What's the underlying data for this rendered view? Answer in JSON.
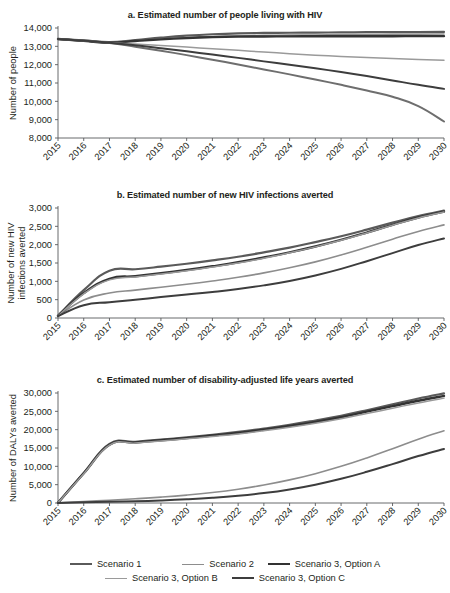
{
  "figure": {
    "x_categories": [
      "2015",
      "2016",
      "2017",
      "2018",
      "2019",
      "2020",
      "2021",
      "2022",
      "2023",
      "2024",
      "2025",
      "2026",
      "2027",
      "2028",
      "2029",
      "2030"
    ],
    "legend": {
      "items": [
        {
          "label": "Scenario 1",
          "color": "#5a5a5a",
          "width": 2.2
        },
        {
          "label": "Scenario 2",
          "color": "#8d8d8d",
          "width": 1.6
        },
        {
          "label": "Scenario 3, Option A",
          "color": "#333333",
          "width": 2.4
        },
        {
          "label": "Scenario 3, Option B",
          "color": "#9a9a9a",
          "width": 1.5
        },
        {
          "label": "Scenario 3, Option C",
          "color": "#3d3d3d",
          "width": 2.0
        }
      ]
    }
  },
  "chart_data": [
    {
      "type": "line",
      "title": "a. Estimated number of people living with HIV",
      "xlabel": "",
      "ylabel": "Number of people",
      "ylabel_lines": [
        "Number of people"
      ],
      "x": [
        2015,
        2016,
        2017,
        2018,
        2019,
        2020,
        2021,
        2022,
        2023,
        2024,
        2025,
        2026,
        2027,
        2028,
        2029,
        2030
      ],
      "categories": [
        "2015",
        "2016",
        "2017",
        "2018",
        "2019",
        "2020",
        "2021",
        "2022",
        "2023",
        "2024",
        "2025",
        "2026",
        "2027",
        "2028",
        "2029",
        "2030"
      ],
      "ylim": [
        8000,
        14000
      ],
      "yticks": [
        8000,
        9000,
        10000,
        11000,
        12000,
        13000,
        14000
      ],
      "ytick_labels": [
        "8,000",
        "9,000",
        "10,000",
        "11,000",
        "12,000",
        "13,000",
        "14,000"
      ],
      "grid": false,
      "legend_position": "figure-bottom",
      "series": [
        {
          "name": "Scenario 1",
          "color": "#5a5a5a",
          "width": 2.2,
          "values": [
            13400,
            13320,
            13230,
            13340,
            13470,
            13580,
            13660,
            13710,
            13730,
            13740,
            13750,
            13760,
            13770,
            13775,
            13780,
            13785
          ]
        },
        {
          "name": "Scenario 2",
          "color": "#8d8d8d",
          "width": 1.6,
          "values": [
            13400,
            13310,
            13220,
            13300,
            13400,
            13480,
            13540,
            13580,
            13600,
            13610,
            13620,
            13630,
            13640,
            13650,
            13660,
            13670
          ]
        },
        {
          "name": "Scenario 3, Option A",
          "color": "#333333",
          "width": 2.4,
          "values": [
            13400,
            13300,
            13200,
            13290,
            13380,
            13450,
            13500,
            13530,
            13540,
            13545,
            13548,
            13550,
            13552,
            13554,
            13556,
            13558
          ]
        },
        {
          "name": "Scenario 3, Option B",
          "color": "#9a9a9a",
          "width": 1.5,
          "values": [
            13400,
            13300,
            13200,
            13130,
            13050,
            12960,
            12870,
            12780,
            12690,
            12600,
            12520,
            12450,
            12390,
            12330,
            12280,
            12240
          ]
        },
        {
          "name": "Scenario 3, Option C",
          "color": "#3d3d3d",
          "width": 2.0,
          "values": [
            13400,
            13300,
            13200,
            13060,
            12900,
            12730,
            12550,
            12370,
            12180,
            11990,
            11800,
            11600,
            11380,
            11140,
            10900,
            10680
          ]
        }
      ],
      "extra_series": [
        {
          "name": "Scenario 3, Option C lower",
          "color": "#6e6e6e",
          "width": 2.0,
          "values": [
            13400,
            13290,
            13180,
            12980,
            12760,
            12520,
            12270,
            12010,
            11740,
            11470,
            11190,
            10900,
            10590,
            10250,
            9740,
            8900
          ]
        }
      ]
    },
    {
      "type": "line",
      "title": "b. Estimated number of new HIV infections averted",
      "xlabel": "",
      "ylabel": "Number of new HIV infections averted",
      "ylabel_lines": [
        "Number of new HIV",
        "infections averted"
      ],
      "x": [
        2015,
        2016,
        2017,
        2018,
        2019,
        2020,
        2021,
        2022,
        2023,
        2024,
        2025,
        2026,
        2027,
        2028,
        2029,
        2030
      ],
      "categories": [
        "2015",
        "2016",
        "2017",
        "2018",
        "2019",
        "2020",
        "2021",
        "2022",
        "2023",
        "2024",
        "2025",
        "2026",
        "2027",
        "2028",
        "2029",
        "2030"
      ],
      "ylim": [
        0,
        3000
      ],
      "yticks": [
        0,
        500,
        1000,
        1500,
        2000,
        2500,
        3000
      ],
      "ytick_labels": [
        "0",
        "500",
        "1,000",
        "1,500",
        "2,000",
        "2,500",
        "3,000"
      ],
      "grid": false,
      "legend_position": "figure-bottom",
      "series": [
        {
          "name": "Scenario 1",
          "color": "#5a5a5a",
          "width": 2.2,
          "values": [
            60,
            760,
            1290,
            1330,
            1400,
            1480,
            1570,
            1670,
            1790,
            1920,
            2070,
            2230,
            2410,
            2600,
            2780,
            2930
          ]
        },
        {
          "name": "Scenario 2",
          "color": "#8d8d8d",
          "width": 1.6,
          "values": [
            55,
            490,
            680,
            760,
            840,
            920,
            1010,
            1110,
            1230,
            1370,
            1530,
            1720,
            1930,
            2150,
            2360,
            2540
          ]
        },
        {
          "name": "Scenario 3, Option A",
          "color": "#333333",
          "width": 2.4,
          "values": [
            60,
            680,
            1070,
            1140,
            1220,
            1310,
            1410,
            1520,
            1650,
            1790,
            1950,
            2130,
            2330,
            2540,
            2740,
            2900
          ]
        },
        {
          "name": "Scenario 3, Option B",
          "color": "#9a9a9a",
          "width": 1.5,
          "values": [
            55,
            660,
            1040,
            1120,
            1200,
            1290,
            1390,
            1500,
            1630,
            1780,
            1940,
            2120,
            2320,
            2530,
            2730,
            2890
          ]
        },
        {
          "name": "Scenario 3, Option C",
          "color": "#3d3d3d",
          "width": 2.0,
          "values": [
            50,
            350,
            430,
            500,
            570,
            640,
            710,
            790,
            890,
            1010,
            1160,
            1340,
            1550,
            1770,
            1990,
            2170
          ]
        }
      ]
    },
    {
      "type": "line",
      "title": "c. Estimated number of disability-adjusted life years averted",
      "xlabel": "",
      "ylabel": "Number of DALYs averted",
      "ylabel_lines": [
        "Number of DALYs averted"
      ],
      "x": [
        2015,
        2016,
        2017,
        2018,
        2019,
        2020,
        2021,
        2022,
        2023,
        2024,
        2025,
        2026,
        2027,
        2028,
        2029,
        2030
      ],
      "categories": [
        "2015",
        "2016",
        "2017",
        "2018",
        "2019",
        "2020",
        "2021",
        "2022",
        "2023",
        "2024",
        "2025",
        "2026",
        "2027",
        "2028",
        "2029",
        "2030"
      ],
      "ylim": [
        0,
        30000
      ],
      "yticks": [
        0,
        5000,
        10000,
        15000,
        20000,
        25000,
        30000
      ],
      "ytick_labels": [
        "0",
        "5,000",
        "10,000",
        "15,000",
        "20,000",
        "25,000",
        "30,000"
      ],
      "grid": false,
      "legend_position": "figure-bottom",
      "series": [
        {
          "name": "Scenario 1",
          "color": "#5a5a5a",
          "width": 2.2,
          "values": [
            60,
            8200,
            16100,
            16700,
            17300,
            17900,
            18600,
            19400,
            20300,
            21300,
            22500,
            23800,
            25300,
            26900,
            28500,
            29900
          ]
        },
        {
          "name": "Scenario 2",
          "color": "#8d8d8d",
          "width": 1.6,
          "values": [
            40,
            400,
            760,
            1150,
            1600,
            2150,
            2850,
            3750,
            4900,
            6300,
            8000,
            10000,
            12300,
            14800,
            17400,
            19700
          ]
        },
        {
          "name": "Scenario 3, Option A",
          "color": "#333333",
          "width": 2.4,
          "values": [
            60,
            8100,
            15900,
            16500,
            17100,
            17700,
            18400,
            19100,
            20000,
            21000,
            22100,
            23400,
            24900,
            26400,
            27900,
            29200
          ]
        },
        {
          "name": "Scenario 3, Option B",
          "color": "#9a9a9a",
          "width": 1.5,
          "values": [
            55,
            8000,
            15800,
            16350,
            16900,
            17500,
            18150,
            18850,
            19700,
            20650,
            21750,
            23000,
            24400,
            25850,
            27300,
            28600
          ]
        },
        {
          "name": "Scenario 3, Option C",
          "color": "#3d3d3d",
          "width": 2.0,
          "values": [
            30,
            180,
            330,
            480,
            700,
            1000,
            1400,
            1950,
            2700,
            3700,
            5000,
            6600,
            8500,
            10600,
            12800,
            14750
          ]
        }
      ]
    }
  ]
}
